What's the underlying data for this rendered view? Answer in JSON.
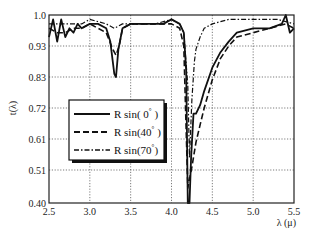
{
  "chart_data": {
    "type": "line",
    "title": "",
    "xlabel": "λ (μ)",
    "ylabel": "t(λ)",
    "xlim": [
      2.5,
      5.5
    ],
    "ylim": [
      0.4,
      1.0
    ],
    "x_ticks": [
      "2.5",
      "3.0",
      "3.5",
      "4.0",
      "4.5",
      "5.0",
      "5.5"
    ],
    "y_ticks": [
      "0.40",
      "0.51",
      "0.61",
      "0.72",
      "0.83",
      "0.93",
      "1.0"
    ],
    "grid": true,
    "legend_position": "lower-left inside",
    "legend": [
      "R sin( 0° )",
      "R sin(40° )",
      "R sin(70° )"
    ],
    "series": [
      {
        "name": "R sin( 0° )",
        "style": "solid",
        "x": [
          2.5,
          2.55,
          2.6,
          2.65,
          2.7,
          2.75,
          2.8,
          2.85,
          2.9,
          3.0,
          3.1,
          3.2,
          3.25,
          3.3,
          3.32,
          3.35,
          3.4,
          3.5,
          3.7,
          3.9,
          4.0,
          4.1,
          4.15,
          4.18,
          4.2,
          4.22,
          4.24,
          4.27,
          4.3,
          4.35,
          4.4,
          4.5,
          4.6,
          4.7,
          4.8,
          5.0,
          5.2,
          5.35,
          5.4,
          5.45,
          5.5
        ],
        "y": [
          0.95,
          0.99,
          0.94,
          0.99,
          0.95,
          0.97,
          0.96,
          0.98,
          0.97,
          0.98,
          0.98,
          0.97,
          0.94,
          0.84,
          0.83,
          0.92,
          0.97,
          0.98,
          0.98,
          0.98,
          0.99,
          0.98,
          0.96,
          0.85,
          0.4,
          0.4,
          0.55,
          0.7,
          0.7,
          0.73,
          0.78,
          0.86,
          0.91,
          0.94,
          0.96,
          0.97,
          0.97,
          0.98,
          1.0,
          0.96,
          0.97
        ]
      },
      {
        "name": "R sin(40° )",
        "style": "dashed",
        "x": [
          2.5,
          2.6,
          2.7,
          2.8,
          2.9,
          3.0,
          3.1,
          3.2,
          3.28,
          3.32,
          3.36,
          3.4,
          3.5,
          3.7,
          3.9,
          4.0,
          4.1,
          4.15,
          4.2,
          4.25,
          4.3,
          4.35,
          4.4,
          4.5,
          4.6,
          4.7,
          4.8,
          5.0,
          5.2,
          5.4,
          5.5
        ],
        "y": [
          0.97,
          0.96,
          0.96,
          0.97,
          0.97,
          0.98,
          0.97,
          0.96,
          0.92,
          0.9,
          0.93,
          0.97,
          0.98,
          0.98,
          0.98,
          0.98,
          0.97,
          0.93,
          0.45,
          0.52,
          0.6,
          0.66,
          0.72,
          0.82,
          0.89,
          0.93,
          0.95,
          0.96,
          0.97,
          0.98,
          0.97
        ]
      },
      {
        "name": "R sin(70° )",
        "style": "dash-dot",
        "x": [
          2.5,
          2.7,
          2.9,
          3.0,
          3.2,
          3.3,
          3.4,
          3.6,
          3.8,
          4.0,
          4.1,
          4.15,
          4.2,
          4.22,
          4.25,
          4.28,
          4.3,
          4.35,
          4.4,
          4.5,
          4.7,
          5.0,
          5.3,
          5.5
        ],
        "y": [
          0.98,
          0.98,
          0.98,
          0.99,
          0.98,
          0.97,
          0.98,
          0.98,
          0.98,
          0.99,
          0.98,
          0.96,
          0.8,
          0.55,
          0.75,
          0.88,
          0.92,
          0.95,
          0.97,
          0.98,
          0.99,
          0.99,
          0.99,
          0.98
        ]
      }
    ]
  },
  "axes": {
    "xlabel": "λ (μ)",
    "ylabel": "t(λ)"
  },
  "legend": {
    "items": [
      {
        "prefix": "R sin( 0",
        "suffix": " )"
      },
      {
        "prefix": "R sin(40",
        "suffix": " )"
      },
      {
        "prefix": "R sin(70",
        "suffix": ")"
      }
    ],
    "degree": "°"
  }
}
